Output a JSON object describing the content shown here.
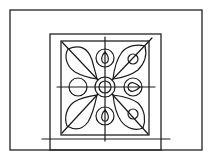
{
  "diagram": {
    "stroke_color": "#1a1a1a",
    "background_color": "#ffffff",
    "outer_frame": {
      "x": 10,
      "y": 10,
      "width": 192,
      "height": 140
    },
    "middle_frame": {
      "x": 50,
      "y": 34,
      "width": 111,
      "height": 116
    },
    "inner_square": {
      "x": 61,
      "y": 41,
      "width": 88,
      "height": 94
    },
    "base_line": {
      "x1": 42,
      "y1": 139,
      "x2": 170,
      "y2": 139
    },
    "axis_lines": {
      "vertical": {
        "x1": 105,
        "y1": 37,
        "x2": 105,
        "y2": 141
      },
      "horizontal": {
        "x1": 57,
        "y1": 87,
        "x2": 155,
        "y2": 87
      }
    },
    "center": {
      "cx": 105,
      "cy": 87,
      "inner_r": 6,
      "outer_r": 10
    },
    "side_circles": [
      {
        "name": "left",
        "cx": 78,
        "cy": 87,
        "r": 9,
        "teardrop": false
      },
      {
        "name": "right",
        "cx": 133,
        "cy": 87,
        "r": 9,
        "teardrop": true
      },
      {
        "name": "top",
        "cx": 105,
        "cy": 58,
        "r": 9,
        "teardrop": true
      },
      {
        "name": "bottom",
        "cx": 105,
        "cy": 116,
        "r": 9,
        "teardrop": true
      }
    ],
    "leaves": [
      {
        "name": "top-left",
        "has_circle": false
      },
      {
        "name": "top-right",
        "has_circle": true
      },
      {
        "name": "bottom-left",
        "has_circle": false
      },
      {
        "name": "bottom-right",
        "has_circle": true
      }
    ],
    "labels": {
      "title": "Ornamental tile rosette diagram"
    }
  }
}
